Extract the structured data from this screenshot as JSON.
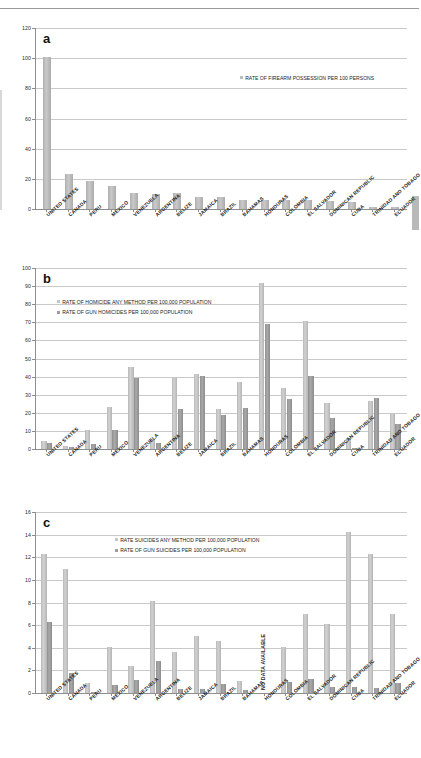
{
  "figure": {
    "panels": [
      "a",
      "b",
      "c"
    ]
  },
  "countries": [
    "UNITED STATES",
    "CANADA",
    "PERU",
    "MEXICO",
    "VENEZUELA",
    "ARGENTINA",
    "BELIZE",
    "JAMAICA",
    "BRAZIL",
    "BAHAMAS",
    "HONDURAS",
    "COLOMBIA",
    "EL SALVADOR",
    "DOMINICAN REPUBLIC",
    "CUBA",
    "TRINIDAD AND TOBAGO",
    "ECUADOR"
  ],
  "chart_data": [
    {
      "id": "a",
      "panel_label": "a",
      "type": "bar",
      "title": "",
      "xlabel": "",
      "ylabel": "",
      "ylim": [
        0,
        120
      ],
      "yticks": [
        0,
        20,
        40,
        60,
        80,
        100,
        120
      ],
      "grid": true,
      "legend_position": "upper-right",
      "categories": [
        "UNITED STATES",
        "CANADA",
        "PERU",
        "MEXICO",
        "VENEZUELA",
        "ARGENTINA",
        "BELIZE",
        "JAMAICA",
        "BRAZIL",
        "BAHAMAS",
        "HONDURAS",
        "COLOMBIA",
        "EL SALVADOR",
        "DOMINICAN REPUBLIC",
        "CUBA",
        "TRINIDAD AND TOBAGO",
        "ECUADOR"
      ],
      "series": [
        {
          "name": "RATE OF FIREARM POSSESSION PER 100 PERSONS",
          "color": "#bdbdbd",
          "values": [
            101,
            23.1,
            18.8,
            15.0,
            10.7,
            10.2,
            10.3,
            8.1,
            8.1,
            6.2,
            6.2,
            6.0,
            5.8,
            5.4,
            4.8,
            1.6,
            1.3
          ]
        }
      ]
    },
    {
      "id": "b",
      "panel_label": "b",
      "type": "bar",
      "title": "",
      "xlabel": "",
      "ylabel": "",
      "ylim": [
        0,
        100
      ],
      "yticks": [
        0,
        10,
        20,
        30,
        40,
        50,
        60,
        70,
        80,
        90,
        100
      ],
      "grid": true,
      "legend_position": "upper-left",
      "categories": [
        "UNITED STATES",
        "CANADA",
        "PERU",
        "MEXICO",
        "VENEZUELA",
        "ARGENTINA",
        "BELIZE",
        "JAMAICA",
        "BRAZIL",
        "BAHAMAS",
        "HONDURAS",
        "COLOMBIA",
        "EL SALVADOR",
        "DOMINICAN REPUBLIC",
        "CUBA",
        "TRINIDAD AND TOBAGO",
        "ECUADOR"
      ],
      "series": [
        {
          "name": "RATE OF HOMICIDE ANY METHOD PER 100,000 POPULATION",
          "color": "#c6c6c6",
          "values": [
            4.7,
            1.4,
            10.3,
            23.4,
            45.1,
            5.8,
            39.3,
            41.5,
            22.0,
            36.9,
            91.8,
            33.8,
            71.0,
            25.5,
            6.2,
            26.8,
            19.3
          ]
        },
        {
          "name": "RATE OF GUN HOMICIDES PER 100,000 POPULATION",
          "color": "#9d9d9d",
          "values": [
            3.5,
            1.0,
            2.7,
            10.4,
            39.5,
            3.4,
            21.9,
            40.6,
            18.7,
            22.7,
            69.1,
            27.6,
            40.6,
            17.1,
            0.2,
            28.0,
            13.8
          ]
        }
      ]
    },
    {
      "id": "c",
      "panel_label": "c",
      "type": "bar",
      "title": "",
      "xlabel": "",
      "ylabel": "",
      "ylim": [
        0,
        16
      ],
      "yticks": [
        0,
        2,
        4,
        6,
        8,
        10,
        12,
        14,
        16
      ],
      "grid": true,
      "legend_position": "upper-center",
      "annotations": [
        {
          "text": "NO DATA AVAILABLE",
          "category": "HONDURAS",
          "rotation": -90
        }
      ],
      "categories": [
        "UNITED STATES",
        "CANADA",
        "PERU",
        "MEXICO",
        "VENEZUELA",
        "ARGENTINA",
        "BELIZE",
        "JAMAICA",
        "BRAZIL",
        "BAHAMAS",
        "HONDURAS",
        "COLOMBIA",
        "EL SALVADOR",
        "DOMINICAN REPUBLIC",
        "CUBA",
        "TRINIDAD AND TOBAGO",
        "ECUADOR"
      ],
      "series": [
        {
          "name": "RATE SUICIDES ANY METHOD PER 100,000 POPULATION",
          "color": "#c6c6c6",
          "values": [
            12.3,
            11.0,
            0.9,
            4.1,
            2.4,
            8.1,
            3.6,
            5.0,
            4.6,
            1.1,
            null,
            4.1,
            7.0,
            6.1,
            14.2,
            12.3,
            7.0
          ]
        },
        {
          "name": "RATE OF GUN SUICIDES PER 100,000 POPULATION",
          "color": "#9d9d9d",
          "values": [
            6.3,
            1.8,
            0.1,
            0.75,
            1.15,
            2.85,
            0.35,
            0.35,
            0.8,
            0.25,
            null,
            1.0,
            1.2,
            0.55,
            0.5,
            0.45,
            0.9
          ]
        }
      ]
    }
  ]
}
